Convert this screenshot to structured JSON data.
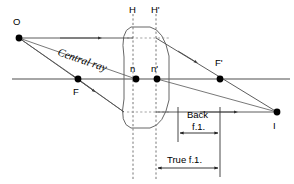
{
  "figure": {
    "background_color": "#ffffff",
    "width": 294,
    "height": 184
  },
  "labels": {
    "object_point": "O",
    "image_point": "I",
    "front_focal_point": "F",
    "rear_focal_point": "F'",
    "front_principal_plane": "H",
    "rear_principal_plane": "H'",
    "front_nodal_point": "n",
    "rear_nodal_point": "n'",
    "central_ray": "Central ray",
    "back_focal_length_line1": "Back",
    "back_focal_length_line2": "f.1.",
    "true_focal_length": "True f.1."
  },
  "points": {
    "O": {
      "x": 19,
      "y": 38
    },
    "I": {
      "x": 277,
      "y": 112
    },
    "F": {
      "x": 78,
      "y": 79
    },
    "F_prime": {
      "x": 220,
      "y": 79
    },
    "n": {
      "x": 136,
      "y": 79
    },
    "n_prime": {
      "x": 157,
      "y": 79
    }
  },
  "geometry": {
    "optical_axis": {
      "x1": 12,
      "y1": 79,
      "x2": 290,
      "y2": 79
    },
    "principal_plane_H_x": 133,
    "principal_plane_H_prime_x": 156,
    "lens_left_x": 124,
    "lens_right_x": 169,
    "lens_top_y": 27,
    "lens_bottom_y": 128,
    "upper_ray_y": 38,
    "lower_ray_y": 112
  },
  "colors": {
    "axis": "#888888",
    "ray": "#4a4a4a",
    "lens": "#666666",
    "dashed": "#777777",
    "dimension": "#222222",
    "text": "#000000",
    "background": "#ffffff"
  },
  "dimensions": {
    "back_focal_length": {
      "from_x": 178,
      "to_x": 220,
      "y": 133
    },
    "true_focal_length": {
      "from_x": 156,
      "to_x": 220,
      "y": 168
    }
  }
}
